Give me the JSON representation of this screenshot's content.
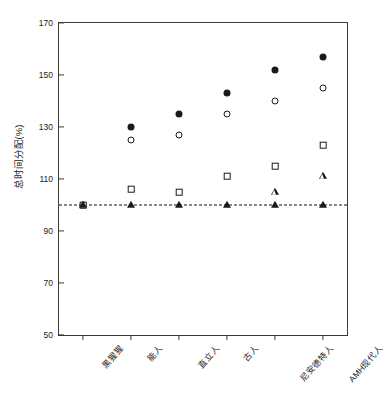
{
  "chart_data": {
    "type": "scatter",
    "title": "",
    "xlabel": "",
    "ylabel": "总时间分配(%)",
    "ylim": [
      50,
      170
    ],
    "yticks": [
      50,
      70,
      90,
      110,
      130,
      150,
      170
    ],
    "grid": false,
    "legend_position": "none",
    "categories": [
      "黑猩猩",
      "能人",
      "直立人",
      "古人",
      "尼安德特人",
      "AMH现代人"
    ],
    "reference_line": {
      "value": 100,
      "style": "dashed",
      "orientation": "horizontal",
      "color": "#111111"
    },
    "series": [
      {
        "name": "filled-circle",
        "marker": "filled-circle",
        "values": [
          100,
          130,
          135,
          143,
          152,
          157
        ]
      },
      {
        "name": "open-circle",
        "marker": "open-circle",
        "values": [
          100,
          125,
          127,
          135,
          140,
          145
        ]
      },
      {
        "name": "open-square",
        "marker": "open-square",
        "values": [
          100,
          106,
          105,
          111,
          115,
          123
        ]
      },
      {
        "name": "open-triangle",
        "marker": "open-triangle",
        "values": [
          null,
          null,
          null,
          null,
          105,
          111
        ]
      },
      {
        "name": "filled-triangle",
        "marker": "filled-triangle",
        "values": [
          100,
          100,
          100,
          100,
          100,
          100
        ]
      }
    ]
  }
}
